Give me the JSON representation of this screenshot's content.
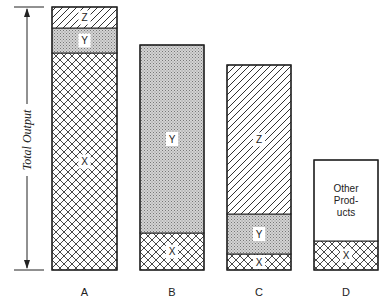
{
  "chart_data": {
    "type": "bar",
    "stacked": true,
    "title": "",
    "xlabel": "",
    "ylabel": "Total Output",
    "categories": [
      "A",
      "B",
      "C",
      "D"
    ],
    "series": [
      {
        "name": "X",
        "pattern": "crosshatch",
        "values": [
          217,
          37,
          16,
          29
        ]
      },
      {
        "name": "Y",
        "pattern": "stipple",
        "values": [
          25,
          188,
          40,
          0
        ]
      },
      {
        "name": "Z",
        "pattern": "diagonal",
        "values": [
          21,
          0,
          149,
          0
        ]
      },
      {
        "name": "Other Products",
        "pattern": "blank",
        "values": [
          0,
          0,
          0,
          81
        ]
      }
    ],
    "grid": false,
    "legend": "inline segment labels"
  },
  "axis": {
    "label": "Total Output"
  },
  "bars": [
    {
      "category": "A",
      "x": 52,
      "width": 65,
      "segments": [
        {
          "name": "X",
          "label": "X",
          "pattern": "cross",
          "top": 53,
          "bottom": 270
        },
        {
          "name": "Y",
          "label": "Y",
          "pattern": "dot",
          "top": 28,
          "bottom": 53
        },
        {
          "name": "Z",
          "label": "Z",
          "pattern": "diag",
          "top": 7,
          "bottom": 28
        }
      ]
    },
    {
      "category": "B",
      "x": 140,
      "width": 64,
      "segments": [
        {
          "name": "X",
          "label": "X",
          "pattern": "cross",
          "top": 233,
          "bottom": 270
        },
        {
          "name": "Y",
          "label": "Y",
          "pattern": "dot",
          "top": 45,
          "bottom": 233
        }
      ]
    },
    {
      "category": "C",
      "x": 227,
      "width": 64,
      "segments": [
        {
          "name": "X",
          "label": "X",
          "pattern": "cross",
          "top": 254,
          "bottom": 270
        },
        {
          "name": "Y",
          "label": "Y",
          "pattern": "dot",
          "top": 214,
          "bottom": 254
        },
        {
          "name": "Z",
          "label": "Z",
          "pattern": "diag",
          "top": 65,
          "bottom": 214
        }
      ]
    },
    {
      "category": "D",
      "x": 314,
      "width": 64,
      "segments": [
        {
          "name": "X",
          "label": "X",
          "pattern": "cross",
          "top": 241,
          "bottom": 270
        },
        {
          "name": "Other Products",
          "label": "Other|Prod-|ucts",
          "pattern": "blank",
          "top": 160,
          "bottom": 241
        }
      ]
    }
  ]
}
